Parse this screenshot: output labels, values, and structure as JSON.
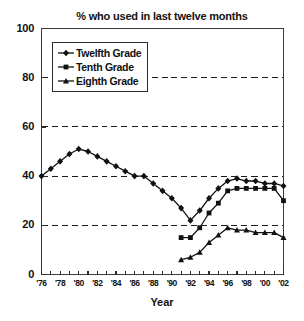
{
  "chart_data": {
    "type": "line",
    "title": "% who used in last twelve months",
    "xlabel": "Year",
    "ylabel": "",
    "ylim": [
      0,
      100
    ],
    "xlim": [
      1976,
      2002
    ],
    "grid": true,
    "grid_values": [
      20,
      40,
      60,
      80
    ],
    "legend_position": "upper-left-inside",
    "y_ticks": [
      "0",
      "20",
      "40",
      "60",
      "80",
      "100"
    ],
    "y_tick_values": [
      0,
      20,
      40,
      60,
      80,
      100
    ],
    "x_ticks": [
      "'76",
      "'78",
      "'80",
      "'82",
      "'84",
      "'86",
      "'88",
      "'90",
      "'92",
      "'94",
      "'96",
      "'98",
      "'00",
      "'02"
    ],
    "x_tick_values": [
      1976,
      1978,
      1980,
      1982,
      1984,
      1986,
      1988,
      1990,
      1992,
      1994,
      1996,
      1998,
      2000,
      2002
    ],
    "x_minor_tick_values": [
      1976,
      1977,
      1978,
      1979,
      1980,
      1981,
      1982,
      1983,
      1984,
      1985,
      1986,
      1987,
      1988,
      1989,
      1990,
      1991,
      1992,
      1993,
      1994,
      1995,
      1996,
      1997,
      1998,
      1999,
      2000,
      2001,
      2002
    ],
    "series": [
      {
        "name": "Twelfth Grade",
        "marker": "diamond",
        "color": "#111111",
        "x": [
          1976,
          1977,
          1978,
          1979,
          1980,
          1981,
          1982,
          1983,
          1984,
          1985,
          1986,
          1987,
          1988,
          1989,
          1990,
          1991,
          1992,
          1993,
          1994,
          1995,
          1996,
          1997,
          1998,
          1999,
          2000,
          2001,
          2002
        ],
        "values": [
          40,
          43,
          46,
          49,
          51,
          50,
          48,
          46,
          44,
          42,
          40,
          40,
          37,
          34,
          31,
          27,
          22,
          26,
          31,
          35,
          38,
          39,
          38,
          38,
          37,
          37,
          36
        ]
      },
      {
        "name": "Tenth Grade",
        "marker": "square",
        "color": "#111111",
        "x": [
          1991,
          1992,
          1993,
          1994,
          1995,
          1996,
          1997,
          1998,
          1999,
          2000,
          2001,
          2002
        ],
        "values": [
          15,
          15,
          19,
          25,
          29,
          34,
          35,
          35,
          35,
          35,
          35,
          30
        ]
      },
      {
        "name": "Eighth Grade",
        "marker": "triangle",
        "color": "#111111",
        "x": [
          1991,
          1992,
          1993,
          1994,
          1995,
          1996,
          1997,
          1998,
          1999,
          2000,
          2001,
          2002
        ],
        "values": [
          6,
          7,
          9,
          13,
          16,
          19,
          18,
          18,
          17,
          17,
          17,
          15
        ]
      }
    ]
  },
  "legend": {
    "items": [
      {
        "label": "Twelfth Grade",
        "marker": "diamond"
      },
      {
        "label": "Tenth Grade",
        "marker": "square"
      },
      {
        "label": "Eighth Grade",
        "marker": "triangle"
      }
    ]
  }
}
